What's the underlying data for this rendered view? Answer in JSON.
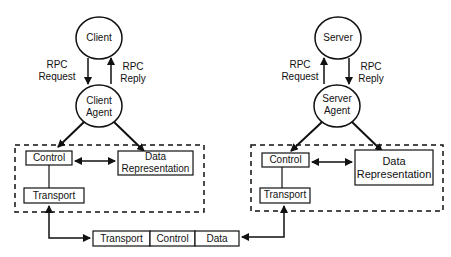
{
  "diagram": {
    "client_side": {
      "process": "Client",
      "agent_line1": "Client",
      "agent_line2": "Agent",
      "request_line1": "RPC",
      "request_line2": "Request",
      "reply_line1": "RPC",
      "reply_line2": "Reply",
      "control": "Control",
      "data_rep_line1": "Data",
      "data_rep_line2": "Representation",
      "transport": "Transport"
    },
    "server_side": {
      "process": "Server",
      "agent_line1": "Server",
      "agent_line2": "Agent",
      "request_line1": "RPC",
      "request_line2": "Request",
      "reply_line1": "RPC",
      "reply_line2": "Reply",
      "control": "Control",
      "data_rep_line1": "Data",
      "data_rep_line2": "Representation",
      "transport": "Transport"
    },
    "message": {
      "fields": [
        "Transport",
        "Control",
        "Data"
      ]
    }
  }
}
